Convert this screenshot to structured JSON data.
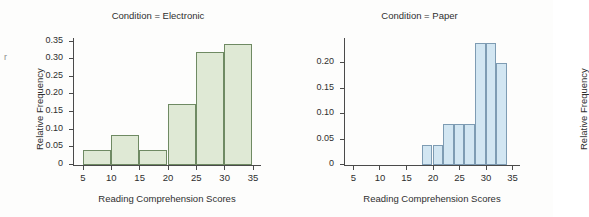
{
  "edge_artifact": "r",
  "panels": [
    {
      "key": "electronic",
      "title": "Condition = Electronic",
      "xlabel": "Reading Comprehension Scores",
      "ylabel": "Relative Frequency"
    },
    {
      "key": "paper",
      "title": "Condition = Paper",
      "xlabel": "Reading Comprehension Scores",
      "ylabel": "Relative Frequency"
    }
  ],
  "chart_data": [
    {
      "type": "bar",
      "title": "Condition = Electronic",
      "xlabel": "Reading Comprehension Scores",
      "ylabel": "Relative Frequency",
      "xlim": [
        3.5,
        36.5
      ],
      "ylim": [
        0,
        0.36
      ],
      "grid": false,
      "legend": "none",
      "bar_color": "#dfe9d5",
      "bar_edge_color": "#6f8a63",
      "xticks": [
        5,
        10,
        15,
        20,
        25,
        30,
        35
      ],
      "xtick_labels": [
        "5",
        "10",
        "15",
        "20",
        "25",
        "30",
        "35"
      ],
      "yticks": [
        0,
        0.05,
        0.1,
        0.15,
        0.2,
        0.25,
        0.3,
        0.35
      ],
      "ytick_labels": [
        "0",
        "0.05",
        "0.10",
        "0.15",
        "0.20",
        "0.25",
        "0.30",
        "0.35"
      ],
      "bin_width": 5,
      "bin_edges": [
        5,
        10,
        15,
        20,
        25,
        30,
        35
      ],
      "bins": [
        {
          "start": 5,
          "end": 10,
          "value": 0.043
        },
        {
          "start": 10,
          "end": 15,
          "value": 0.086
        },
        {
          "start": 15,
          "end": 20,
          "value": 0.043
        },
        {
          "start": 20,
          "end": 25,
          "value": 0.172
        },
        {
          "start": 25,
          "end": 30,
          "value": 0.321
        },
        {
          "start": 30,
          "end": 35,
          "value": 0.343
        }
      ],
      "values": [
        0.043,
        0.086,
        0.043,
        0.172,
        0.321,
        0.343
      ]
    },
    {
      "type": "bar",
      "title": "Condition = Paper",
      "xlabel": "Reading Comprehension Scores",
      "ylabel": "Relative Frequency",
      "xlim": [
        3.5,
        36.5
      ],
      "ylim": [
        0,
        0.25
      ],
      "grid": false,
      "legend": "none",
      "bar_color": "#d2e6f2",
      "bar_edge_color": "#7e9cb3",
      "xticks": [
        5,
        10,
        15,
        20,
        25,
        30,
        35
      ],
      "xtick_labels": [
        "5",
        "10",
        "15",
        "20",
        "25",
        "30",
        "35"
      ],
      "yticks": [
        0,
        0.05,
        0.1,
        0.15,
        0.2
      ],
      "ytick_labels": [
        "0",
        "0.05",
        "0.10",
        "0.15",
        "0.20"
      ],
      "bin_width": 2,
      "bin_edges": [
        18,
        20,
        22,
        24,
        26,
        28,
        30,
        32,
        34
      ],
      "bins": [
        {
          "start": 18,
          "end": 20,
          "value": 0.04
        },
        {
          "start": 20,
          "end": 22,
          "value": 0.04
        },
        {
          "start": 22,
          "end": 24,
          "value": 0.08
        },
        {
          "start": 24,
          "end": 26,
          "value": 0.08
        },
        {
          "start": 26,
          "end": 28,
          "value": 0.08
        },
        {
          "start": 28,
          "end": 30,
          "value": 0.24
        },
        {
          "start": 30,
          "end": 32,
          "value": 0.24
        },
        {
          "start": 32,
          "end": 34,
          "value": 0.2
        }
      ],
      "values": [
        0.04,
        0.04,
        0.08,
        0.08,
        0.08,
        0.24,
        0.24,
        0.2
      ]
    }
  ]
}
